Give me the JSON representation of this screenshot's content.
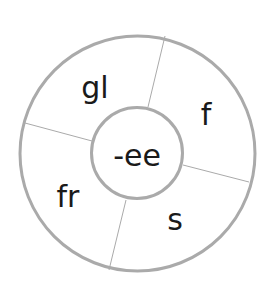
{
  "diagram": {
    "type": "word-wheel",
    "center_label": "-ee",
    "segments": [
      {
        "label": "gl"
      },
      {
        "label": "f"
      },
      {
        "label": "s"
      },
      {
        "label": "fr"
      }
    ],
    "colors": {
      "stroke": "#aaaaaa",
      "text": "#1a1a1a",
      "background": "#ffffff"
    }
  }
}
